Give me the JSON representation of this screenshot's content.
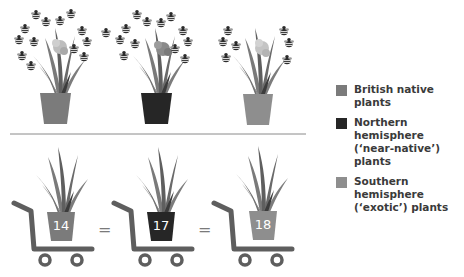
{
  "colors": {
    "british_native": "#7b7b7b",
    "northern_hemisphere": "#262626",
    "southern_hemisphere": "#8e8e8e",
    "divider": "#8a8a8a",
    "trolley": "#5e5e5e",
    "bee": "#2b2b2b",
    "leaves": "#6f6f6f"
  },
  "top_panel": {
    "plants": [
      {
        "category": "British native plants",
        "pot_color": "#7b7b7b",
        "bee_count": 13
      },
      {
        "category": "Northern hemisphere ('near-native') plants",
        "pot_color": "#262626",
        "bee_count": 13
      },
      {
        "category": "Southern hemisphere ('exotic') plants",
        "pot_color": "#8e8e8e",
        "bee_count": 7
      }
    ]
  },
  "bottom_panel": {
    "trolleys": [
      {
        "value": "14",
        "pot_color": "#7b7b7b"
      },
      {
        "value": "17",
        "pot_color": "#262626"
      },
      {
        "value": "18",
        "pot_color": "#8e8e8e"
      }
    ],
    "separator": "="
  },
  "legend": {
    "items": [
      {
        "label": "British native plants",
        "color": "#7b7b7b"
      },
      {
        "label": "Northern hemisphere\n(‘near-native’) plants",
        "color": "#262626"
      },
      {
        "label": "Southern hemisphere\n(‘exotic’) plants",
        "color": "#8e8e8e"
      }
    ]
  }
}
